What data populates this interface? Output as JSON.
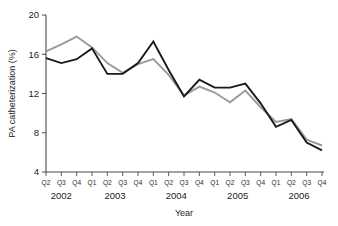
{
  "chart_data": {
    "type": "line",
    "title": "",
    "xlabel": "Year",
    "ylabel": "PA catheterization (%)",
    "ylim": [
      4,
      20
    ],
    "yticks": [
      4,
      8,
      12,
      16,
      20
    ],
    "ytick_labels": [
      "4",
      "8",
      "12",
      "16",
      "20"
    ],
    "grid": false,
    "legend": "none",
    "x": [
      "Q2",
      "Q3",
      "Q4",
      "Q1",
      "Q2",
      "Q3",
      "Q4",
      "Q1",
      "Q2",
      "Q3",
      "Q4",
      "Q1",
      "Q2",
      "Q3",
      "Q4",
      "Q1",
      "Q2",
      "Q3",
      "Q4"
    ],
    "xtick_labels": [
      "Q2",
      "Q3",
      "Q4",
      "Q1",
      "Q2",
      "Q3",
      "Q4",
      "Q1",
      "Q2",
      "Q3",
      "Q4",
      "Q1",
      "Q2",
      "Q3",
      "Q4",
      "Q1",
      "Q2",
      "Q3",
      "Q4"
    ],
    "year_groups": [
      {
        "label": "2002",
        "quarters": [
          "Q2",
          "Q3",
          "Q4"
        ],
        "start_index": 0,
        "end_index": 2
      },
      {
        "label": "2003",
        "quarters": [
          "Q1",
          "Q2",
          "Q3",
          "Q4"
        ],
        "start_index": 3,
        "end_index": 6
      },
      {
        "label": "2004",
        "quarters": [
          "Q1",
          "Q2",
          "Q3",
          "Q4"
        ],
        "start_index": 7,
        "end_index": 10
      },
      {
        "label": "2005",
        "quarters": [
          "Q1",
          "Q2",
          "Q3",
          "Q4"
        ],
        "start_index": 11,
        "end_index": 14
      },
      {
        "label": "2006",
        "quarters": [
          "Q1",
          "Q2",
          "Q3",
          "Q4"
        ],
        "start_index": 15,
        "end_index": 18
      }
    ],
    "series": [
      {
        "name": "series-black",
        "color": "#1a1a1a",
        "width": 1.9,
        "values": [
          15.6,
          15.1,
          15.5,
          16.6,
          14.0,
          14.0,
          15.1,
          17.3,
          14.4,
          11.7,
          13.4,
          12.6,
          12.6,
          13.0,
          11.0,
          8.6,
          9.3,
          7.0,
          6.2
        ]
      },
      {
        "name": "series-gray",
        "color": "#9a9a9a",
        "width": 1.9,
        "values": [
          16.3,
          17.0,
          17.8,
          16.7,
          15.1,
          14.1,
          15.0,
          15.5,
          13.9,
          11.8,
          12.7,
          12.1,
          11.1,
          12.3,
          10.6,
          9.1,
          9.4,
          7.3,
          6.7
        ]
      }
    ]
  },
  "geometry": {
    "plot_left": 46,
    "plot_right": 322,
    "plot_top": 15,
    "plot_bottom": 172
  }
}
